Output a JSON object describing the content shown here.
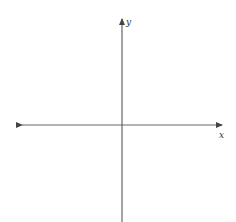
{
  "diagram": {
    "type": "cartesian-axes",
    "axes": {
      "x": {
        "label": "x",
        "direction": "horizontal",
        "arrows": [
          "left",
          "right"
        ]
      },
      "y": {
        "label": "y",
        "direction": "vertical",
        "arrows": [
          "up"
        ]
      }
    },
    "colors": {
      "axis": "#555555",
      "label": "#333333",
      "background": "#ffffff"
    }
  }
}
